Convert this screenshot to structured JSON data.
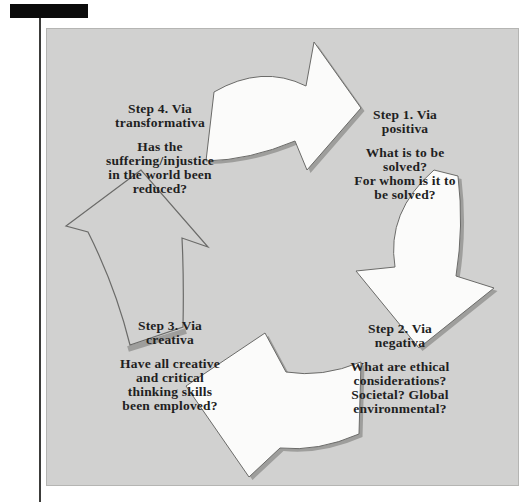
{
  "colors": {
    "page_background": "#ffffff",
    "redaction_bar": "#0b0b0b",
    "margin_rule": "#3c3c3a",
    "diagram_background": "#d1d1d0",
    "diagram_border": "#b5b5b3",
    "arrow_fill": "#fbfbfa",
    "arrow_outline": "#6b6b69",
    "arrow_shadow": "#9e9e9c",
    "text": "#1f1f1f"
  },
  "diagram": {
    "type": "cycle",
    "steps": [
      {
        "key": "step-1",
        "title_lines": [
          "Step 1. Via",
          "positiva"
        ],
        "question_lines": [
          "What is to be",
          "solved?",
          "For whom is it to",
          "be solved?"
        ]
      },
      {
        "key": "step-2",
        "title_lines": [
          "Step 2. Via",
          "negativa"
        ],
        "question_lines": [
          "What are ethical",
          "considerations?",
          "Societal? Global",
          "environmental?"
        ]
      },
      {
        "key": "step-3",
        "title_lines": [
          "Step 3. Via",
          "creativa"
        ],
        "question_lines": [
          "Have all creative",
          "and critical",
          "thinking skills",
          "been emploved?"
        ]
      },
      {
        "key": "step-4",
        "title_lines": [
          "Step 4. Via",
          "transformativa"
        ],
        "question_lines": [
          "Has the",
          "suffering/injustice",
          "in the world been",
          "reduced?"
        ]
      }
    ],
    "arrows": [
      {
        "name": "top-arrow",
        "points": "right",
        "style": "filled-with-shadow"
      },
      {
        "name": "right-arrow",
        "points": "down",
        "style": "filled-with-shadow"
      },
      {
        "name": "bottom-arrow",
        "points": "left",
        "style": "filled-with-shadow"
      },
      {
        "name": "left-arrow",
        "points": "up",
        "style": "outline-only"
      }
    ]
  }
}
